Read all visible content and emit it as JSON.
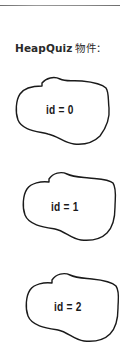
{
  "header": {
    "title_latin": "HeapQuiz",
    "title_cjk": "物件："
  },
  "objects": [
    {
      "label": "id = 0"
    },
    {
      "label": "id = 1"
    },
    {
      "label": "id = 2"
    }
  ],
  "colors": {
    "stroke": "#1a1a1a",
    "text": "#2a2a2a",
    "rule": "#8a8a8a",
    "background": "#ffffff"
  }
}
